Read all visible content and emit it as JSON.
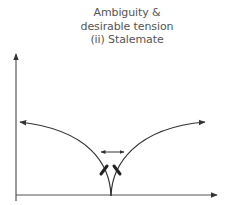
{
  "diagram": {
    "title_lines": [
      "Ambiguity &",
      "desirable tension",
      "(ii) Stalemate"
    ],
    "axes": {
      "x_axis": {
        "label": ""
      },
      "y_axis": {
        "label": ""
      }
    },
    "elements": [
      {
        "type": "curve",
        "name": "left-diverging-curve",
        "direction": "up-left",
        "arrowhead": true
      },
      {
        "type": "curve",
        "name": "right-diverging-curve",
        "direction": "up-right",
        "arrowhead": true
      },
      {
        "type": "double-arrow",
        "name": "tension-arrow",
        "orientation": "horizontal"
      },
      {
        "type": "mark",
        "name": "left-block-mark"
      },
      {
        "type": "mark",
        "name": "right-block-mark"
      }
    ],
    "colors": {
      "line": "#333333",
      "text": "#555555",
      "background": "#ffffff"
    }
  }
}
